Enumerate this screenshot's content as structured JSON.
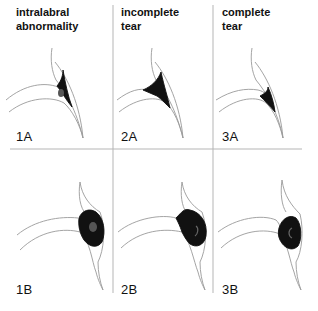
{
  "figure": {
    "columns": [
      {
        "id": "1",
        "title_line1": "intralabral",
        "title_line2": "abnormality"
      },
      {
        "id": "2",
        "title_line1": "incomplete",
        "title_line2": "tear"
      },
      {
        "id": "3",
        "title_line1": "complete",
        "title_line2": "tear"
      }
    ],
    "panels": {
      "p1A": "1A",
      "p2A": "2A",
      "p3A": "3A",
      "p1B": "1B",
      "p2B": "2B",
      "p3B": "3B"
    },
    "colors": {
      "line": "#9a9a9a",
      "lesion": "#111111",
      "divider": "#b5b5b5",
      "text": "#111111"
    }
  }
}
